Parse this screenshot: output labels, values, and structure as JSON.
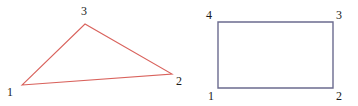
{
  "figure": {
    "background_color": "#ffffff",
    "width": 358,
    "height": 106,
    "label_color": "#1a1a1a",
    "shapes": [
      {
        "id": "triangle",
        "name": "triangle",
        "stroke_color": "#d9625c",
        "stroke_width": 1.1,
        "fill": "none",
        "points": "22,85 172,74 85,24",
        "vertices": [
          {
            "label": "1",
            "x": 22,
            "y": 85,
            "label_x": 7,
            "label_y": 86
          },
          {
            "label": "2",
            "x": 172,
            "y": 74,
            "label_x": 176,
            "label_y": 75
          },
          {
            "label": "3",
            "x": 85,
            "y": 24,
            "label_x": 81,
            "label_y": 5
          }
        ]
      },
      {
        "id": "rectangle",
        "name": "rectangle",
        "stroke_color": "#6b6b8f",
        "stroke_width": 1.4,
        "fill": "none",
        "points": "218,88 333,88 333,22 218,22",
        "vertices": [
          {
            "label": "1",
            "x": 218,
            "y": 88,
            "label_x": 208,
            "label_y": 90
          },
          {
            "label": "2",
            "x": 333,
            "y": 88,
            "label_x": 336,
            "label_y": 90
          },
          {
            "label": "3",
            "x": 333,
            "y": 22,
            "label_x": 336,
            "label_y": 9
          },
          {
            "label": "4",
            "x": 218,
            "y": 22,
            "label_x": 206,
            "label_y": 9
          }
        ]
      }
    ]
  }
}
